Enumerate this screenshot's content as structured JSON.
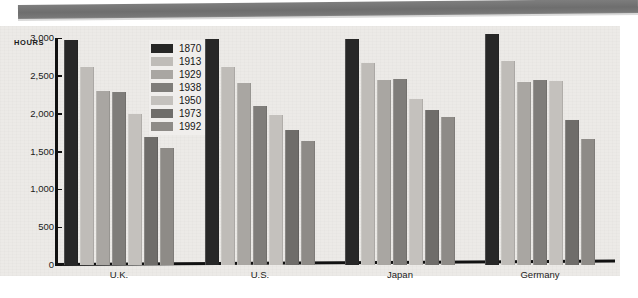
{
  "chart_data": {
    "type": "bar",
    "title": "",
    "subtitle": "",
    "xlabel": "",
    "ylabel": "HOURS",
    "ylim": [
      0,
      3000
    ],
    "yticks": [
      "0",
      "500",
      "1,000",
      "1,500",
      "2,000",
      "2,500",
      "3,000"
    ],
    "ytick_values": [
      0,
      500,
      1000,
      1500,
      2000,
      2500,
      3000
    ],
    "grid": false,
    "legend_position": "top-center",
    "categories": [
      "U.K.",
      "U.S.",
      "Japan",
      "Germany"
    ],
    "series": [
      {
        "name": "1870",
        "color": "#272727",
        "values": [
          2970,
          2990,
          2990,
          3050
        ]
      },
      {
        "name": "1913",
        "color": "#bfbcb8",
        "values": [
          2620,
          2620,
          2670,
          2690
        ]
      },
      {
        "name": "1929",
        "color": "#a9a6a2",
        "values": [
          2300,
          2400,
          2450,
          2420
        ]
      },
      {
        "name": "1938",
        "color": "#7f7d7a",
        "values": [
          2290,
          2100,
          2460,
          2440
        ]
      },
      {
        "name": "1950",
        "color": "#c4c1bd",
        "values": [
          2000,
          1980,
          2200,
          2430
        ]
      },
      {
        "name": "1973",
        "color": "#6f6d6a",
        "values": [
          1690,
          1790,
          2050,
          1910
        ]
      },
      {
        "name": "1992",
        "color": "#8e8b87",
        "values": [
          1540,
          1640,
          1950,
          1670
        ]
      }
    ]
  },
  "legend": {
    "items": [
      {
        "label": "1870"
      },
      {
        "label": "1913"
      },
      {
        "label": "1929"
      },
      {
        "label": "1938"
      },
      {
        "label": "1950"
      },
      {
        "label": "1973"
      },
      {
        "label": "1992"
      }
    ]
  },
  "axis": {
    "y_title": "HOURS",
    "y_labels": [
      "3,000",
      "2,500",
      "2,000",
      "1,500",
      "1,000",
      "500",
      "0"
    ],
    "x_labels": [
      "U.K.",
      "U.S.",
      "Japan",
      "Germany"
    ]
  },
  "colors": {
    "banner": "#6e6e6e",
    "paper": "#eceae7",
    "axis": "#111111",
    "text": "#1b1b1b"
  }
}
